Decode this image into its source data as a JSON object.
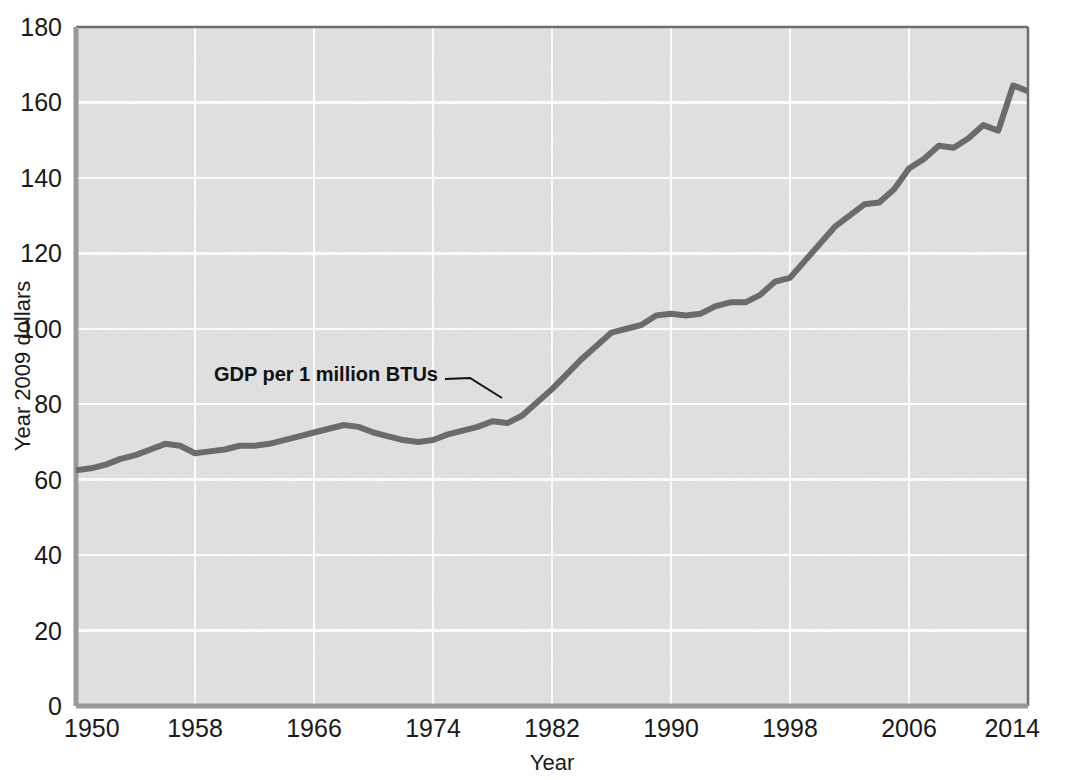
{
  "chart_data": {
    "type": "line",
    "title": "",
    "subtitle": "",
    "xlabel": "Year",
    "ylabel": "Year 2009 dollars",
    "xlim": [
      1950,
      2014
    ],
    "ylim": [
      0,
      180
    ],
    "xticks": [
      1950,
      1958,
      1966,
      1974,
      1982,
      1990,
      1998,
      2006,
      2014
    ],
    "yticks": [
      0,
      20,
      40,
      60,
      80,
      100,
      120,
      140,
      160,
      180
    ],
    "grid": true,
    "legend_position": "none",
    "annotations": [
      {
        "text": "GDP per 1 million BTUs",
        "x": 1974,
        "y": 88,
        "points_to_x": 1981,
        "points_to_y": 82
      }
    ],
    "series": [
      {
        "name": "GDP per 1 million BTUs",
        "color": "#6b6b6b",
        "x": [
          1950,
          1951,
          1952,
          1953,
          1954,
          1955,
          1956,
          1957,
          1958,
          1959,
          1960,
          1961,
          1962,
          1963,
          1964,
          1965,
          1966,
          1967,
          1968,
          1969,
          1970,
          1971,
          1972,
          1973,
          1974,
          1975,
          1976,
          1977,
          1978,
          1979,
          1980,
          1981,
          1982,
          1983,
          1984,
          1985,
          1986,
          1987,
          1988,
          1989,
          1990,
          1991,
          1992,
          1993,
          1994,
          1995,
          1996,
          1997,
          1998,
          1999,
          2000,
          2001,
          2002,
          2003,
          2004,
          2005,
          2006,
          2007,
          2008,
          2009,
          2010,
          2011,
          2012,
          2013,
          2014
        ],
        "values": [
          62.5,
          63.0,
          64.0,
          65.5,
          66.5,
          68.0,
          69.5,
          69.0,
          67.0,
          67.5,
          68.0,
          69.0,
          69.0,
          69.5,
          70.5,
          71.5,
          72.5,
          73.5,
          74.5,
          74.0,
          72.5,
          71.5,
          70.5,
          70.0,
          70.5,
          72.0,
          73.0,
          74.0,
          75.5,
          75.0,
          77.0,
          80.5,
          84.0,
          88.0,
          92.0,
          95.5,
          99.0,
          100.0,
          101.0,
          103.5,
          104.0,
          103.5,
          104.0,
          106.0,
          107.0,
          107.0,
          109.0,
          112.5,
          113.5,
          118.0,
          122.5,
          127.0,
          130.0,
          133.0,
          133.5,
          137.0,
          142.5,
          145.0,
          148.5,
          148.0,
          150.5,
          154.0,
          152.5,
          164.5,
          163.0
        ]
      }
    ]
  },
  "axes": {
    "y_tick_labels": [
      "180",
      "160",
      "140",
      "120",
      "100",
      "80",
      "60",
      "40",
      "20",
      "0"
    ],
    "x_tick_labels": [
      "1950",
      "1958",
      "1966",
      "1974",
      "1982",
      "1990",
      "1998",
      "2006",
      "2014"
    ],
    "x_axis_title": "Year",
    "y_axis_title": "Year 2009 dollars"
  },
  "annotation": {
    "label": "GDP per 1 million BTUs"
  },
  "colors": {
    "plot_background": "#e2e2e2",
    "gridline": "#fbfbfb",
    "series_line": "#6d6d6d",
    "axis_text": "#1a1a1a",
    "plot_border": "#8f8f8f",
    "page_background": "#ffffff"
  }
}
